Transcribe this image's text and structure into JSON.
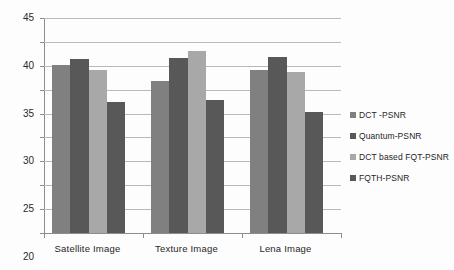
{
  "chart_data": {
    "type": "bar",
    "title": "",
    "subtitle": "",
    "xlabel": "",
    "ylabel": "",
    "ylim": [
      0,
      45
    ],
    "ytick_step": 5,
    "yticks": [
      "0",
      "5",
      "10",
      "15",
      "20",
      "25",
      "30",
      "35",
      "40",
      "45"
    ],
    "grid": true,
    "legend_position": "right",
    "categories": [
      "Satellite Image",
      "Texture Image",
      "Lena Image"
    ],
    "series": [
      {
        "name": "DCT -PSNR",
        "color": "#808080",
        "values": [
          35.2,
          31.9,
          34.1
        ]
      },
      {
        "name": "Quantum-PSNR",
        "color": "#585858",
        "values": [
          36.5,
          36.7,
          36.8
        ]
      },
      {
        "name": "DCT based FQT-PSNR",
        "color": "#a8a8a8",
        "values": [
          34.2,
          38.0,
          33.7
        ]
      },
      {
        "name": "FQTH-PSNR",
        "color": "#585858",
        "values": [
          27.5,
          27.9,
          25.4
        ]
      }
    ]
  },
  "axis": {
    "axis_color": "#8d8d8d",
    "gridline_color": "#b9b9b9"
  }
}
